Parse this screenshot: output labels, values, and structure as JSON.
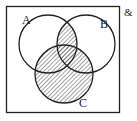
{
  "diagram": {
    "type": "venn",
    "universal_symbol": "&",
    "sets": [
      {
        "label": "A",
        "cx": 48,
        "cy": 44,
        "r": 29,
        "label_x": 22,
        "label_y": 24
      },
      {
        "label": "B",
        "cx": 86,
        "cy": 44,
        "r": 29,
        "label_x": 100,
        "label_y": 28
      },
      {
        "label": "C",
        "cx": 64,
        "cy": 74,
        "r": 29,
        "label_x": 79,
        "label_y": 107
      }
    ],
    "shaded_region": "(A ∩ B) ∪ C",
    "colors": {
      "stroke": "#222222",
      "hatch": "#555555",
      "background": "#ffffff"
    }
  }
}
